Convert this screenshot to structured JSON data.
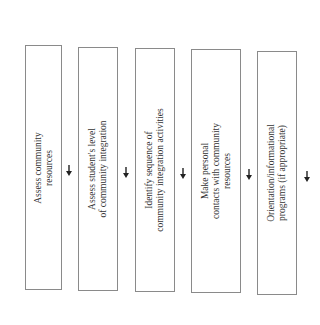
{
  "diagram": {
    "type": "flowchart",
    "orientation": "rotated-90-ccw",
    "steps": [
      {
        "label": "Assess community\nresources"
      },
      {
        "label": "Assess student's level\nof community integration"
      },
      {
        "label": "Identify sequence of\ncommunity integration activities"
      },
      {
        "label": "Make personal\ncontacts with community\nresources"
      },
      {
        "label": "Orientation/informational\nprograms (if appropriate)"
      }
    ],
    "connectors": [
      {
        "from": 0,
        "to": 1,
        "icon": "arrow-icon"
      },
      {
        "from": 1,
        "to": 2,
        "icon": "arrow-icon"
      },
      {
        "from": 2,
        "to": 3,
        "icon": "arrow-icon"
      },
      {
        "from": 3,
        "to": 4,
        "icon": "arrow-icon"
      },
      {
        "from": 4,
        "to": null,
        "icon": "arrow-icon"
      }
    ],
    "colors": {
      "border": "#8a8a8a",
      "text": "#333333",
      "arrow": "#222222"
    }
  }
}
